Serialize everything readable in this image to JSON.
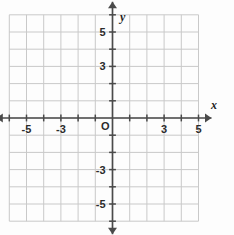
{
  "chart_data": {
    "type": "scatter",
    "title": "",
    "xlabel": "x",
    "ylabel": "y",
    "xlim": [
      -6,
      5
    ],
    "ylim": [
      -6,
      6
    ],
    "grid": true,
    "legend": false,
    "series": [],
    "x_tick_labels": [
      "-5",
      "-3",
      "3",
      "5"
    ],
    "x_tick_values": [
      -5,
      -3,
      3,
      5
    ],
    "y_tick_labels": [
      "5",
      "3",
      "-3",
      "-5"
    ],
    "y_tick_values": [
      5,
      3,
      -3,
      -5
    ],
    "origin_label": "O",
    "minor_tick_values_x": [
      -6,
      -5,
      -4,
      -3,
      -2,
      -1,
      1,
      2,
      3,
      4,
      5
    ],
    "minor_tick_values_y": [
      -6,
      -5,
      -4,
      -3,
      -2,
      -1,
      1,
      2,
      3,
      4,
      5,
      6
    ],
    "annotations": []
  },
  "graph": {
    "x_axis_name": "x",
    "y_axis_name": "y",
    "origin_label": "O",
    "x_labels": [
      {
        "text": "-5",
        "value": -5
      },
      {
        "text": "-3",
        "value": -3
      },
      {
        "text": "3",
        "value": 3
      },
      {
        "text": "5",
        "value": 5
      }
    ],
    "y_labels": [
      {
        "text": "5",
        "value": 5
      },
      {
        "text": "3",
        "value": 3
      },
      {
        "text": "-3",
        "value": -3
      },
      {
        "text": "-5",
        "value": -5
      }
    ],
    "colors": {
      "background": "#fdfdfd",
      "grid": "#c9c9c9",
      "axis": "#4a4a4a",
      "label": "#2b2b2b"
    }
  }
}
